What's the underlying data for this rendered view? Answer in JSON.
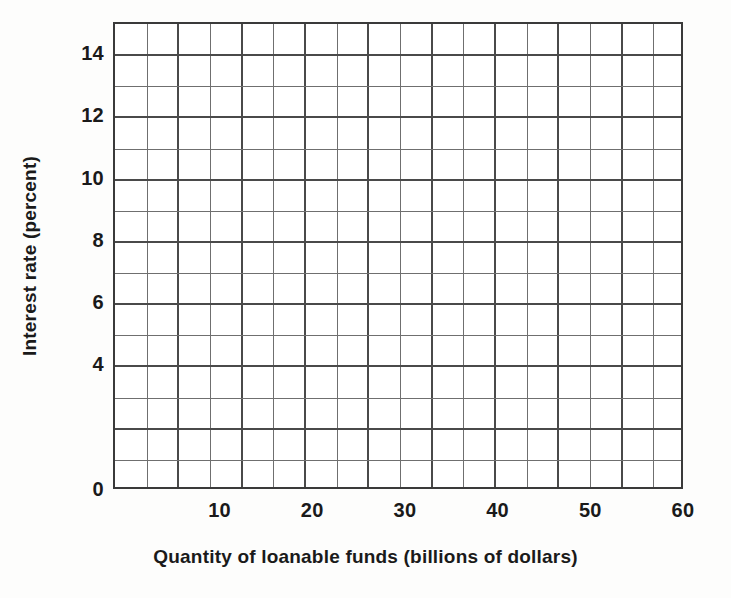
{
  "chart_data": {
    "type": "table",
    "title": "",
    "subtitle": "",
    "xlabel": "Quantity of loanable funds (billions of dollars)",
    "ylabel": "Interest rate (percent)",
    "xlim": [
      -1.5,
      60
    ],
    "ylim": [
      0,
      15
    ],
    "grid": true,
    "legend": null,
    "series": [],
    "annotations": [],
    "note": "Blank graph-paper grid for plotting supply/demand of loanable funds; no data series drawn.",
    "x_ticks_labeled": [
      10,
      20,
      30,
      40,
      50,
      60
    ],
    "x_tick_labels": [
      "10",
      "20",
      "30",
      "40",
      "50",
      "60"
    ],
    "y_ticks_labeled": [
      0,
      4,
      6,
      8,
      10,
      12,
      14
    ],
    "y_tick_labels": [
      "0",
      "4",
      "6",
      "8",
      "10",
      "12",
      "14"
    ],
    "x_gridline_step": 3.4146,
    "y_gridline_step": 1,
    "columns": 18,
    "rows": 15,
    "major_every_x": 2,
    "major_every_y": 2
  },
  "axes": {
    "x_title": "Quantity of loanable funds (billions of dollars)",
    "y_title": "Interest rate (percent)",
    "x_tick_labels": [
      "10",
      "20",
      "30",
      "40",
      "50",
      "60"
    ],
    "y_tick_labels": [
      "14",
      "12",
      "10",
      "8",
      "6",
      "4",
      "0"
    ]
  },
  "colors": {
    "background": "#fdfdfc",
    "plot_background": "#ffffff",
    "major_gridline": "#4a4a4a",
    "minor_gridline": "#6f6f6f",
    "border": "#3a3a3a",
    "text": "#1a1a1a"
  }
}
